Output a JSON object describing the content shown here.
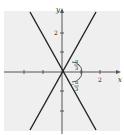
{
  "diagram": {
    "type": "graph-of-lines",
    "axes": {
      "x_label": "x",
      "y_label": "y"
    },
    "ticks": {
      "x_labels": [
        "2"
      ],
      "y_labels": [
        "2"
      ]
    },
    "angle_labels": {
      "upper": {
        "num": "π",
        "den": "3"
      },
      "lower": {
        "sign": "−",
        "num": "π",
        "den": "3"
      }
    },
    "lines": [
      {
        "name": "line-positive-slope",
        "angle": "π/3"
      },
      {
        "name": "line-negative-slope",
        "angle": "−π/3"
      }
    ],
    "colors": {
      "shade": "#efefef",
      "line": "#222222",
      "axis": "#555555"
    }
  }
}
